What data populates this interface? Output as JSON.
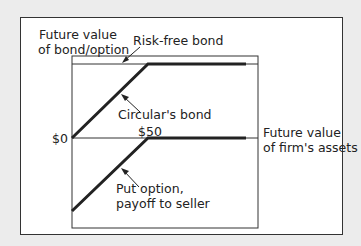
{
  "diagram": {
    "y_axis_label_line1": "Future value",
    "y_axis_label_line2": "of bond/option",
    "x_axis_label_line1": "Future value",
    "x_axis_label_line2": "of firm's assets",
    "risk_free_label": "Risk-free bond",
    "circular_label": "Circular's bond",
    "put_label_line1": "Put option,",
    "put_label_line2": "payoff to seller",
    "zero_label": "$0",
    "strike_label": "$50",
    "colors": {
      "background": "#ececec",
      "panel": "#ffffff",
      "line": "#222222"
    }
  }
}
